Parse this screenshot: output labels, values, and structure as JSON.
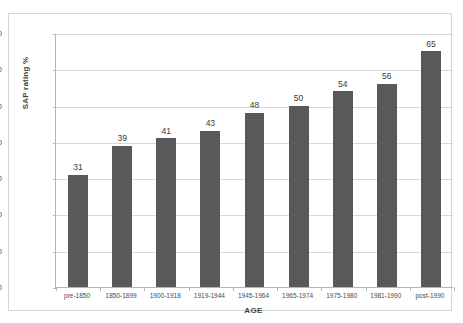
{
  "chart_data": {
    "type": "bar",
    "title": "",
    "subtitle": "",
    "xlabel": "AGE",
    "ylabel": "SAP rating %",
    "categories": [
      "pre-1850",
      "1850-1899",
      "1900-1918",
      "1919-1944",
      "1945-1964",
      "1965-1974",
      "1975-1980",
      "1981-1990",
      "post-1990"
    ],
    "values": [
      31,
      39,
      41,
      43,
      48,
      50,
      54,
      56,
      65
    ],
    "data_labels": [
      "31",
      "39",
      "41",
      "43",
      "48",
      "50",
      "54",
      "56",
      "65"
    ],
    "ylim": [
      0,
      70
    ],
    "yticks": [
      0,
      10,
      20,
      30,
      40,
      50,
      60,
      70
    ],
    "ytick_labels": [
      "0",
      "10",
      "20",
      "30",
      "40",
      "50",
      "60",
      "70"
    ],
    "grid": "horizontal",
    "legend": "none",
    "bar_color": "#595959",
    "gridline_color": "#d9d9d9",
    "axis_color": "#b6b6b6",
    "plot_background": "#ffffff",
    "frame_border_color": "#d5d5d5"
  }
}
